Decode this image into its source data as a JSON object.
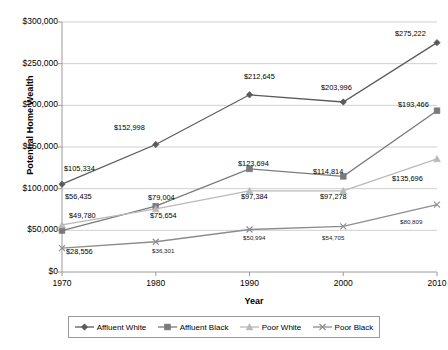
{
  "chart_data": {
    "type": "line",
    "title": "",
    "xlabel": "Year",
    "ylabel": "Potential Home Wealth",
    "categories": [
      "1970",
      "1980",
      "1990",
      "2000",
      "2010"
    ],
    "x": [
      1970,
      1980,
      1990,
      2000,
      2010
    ],
    "ylim": [
      0,
      300000
    ],
    "ytick_labels": [
      "$0",
      "$50,000",
      "$100,000",
      "$150,000",
      "$200,000",
      "$250,000",
      "$300,000"
    ],
    "ytick_values": [
      0,
      50000,
      100000,
      150000,
      200000,
      250000,
      300000
    ],
    "grid": true,
    "legend_position": "bottom",
    "series": [
      {
        "name": "Affluent White",
        "marker": "diamond",
        "color": "#5b5b5b",
        "values": [
          105334,
          152998,
          212645,
          203996,
          275222
        ],
        "labels": [
          "$105,334",
          "$152,998",
          "$212,645",
          "$203,996",
          "$275,222"
        ]
      },
      {
        "name": "Affluent Black",
        "marker": "square",
        "color": "#7a7a7a",
        "values": [
          49780,
          79004,
          123694,
          114814,
          193466
        ],
        "labels": [
          "$49,780",
          "$79,004",
          "$123,694",
          "$114,814",
          "$193,466"
        ]
      },
      {
        "name": "Poor White",
        "marker": "triangle",
        "color": "#b9b9b9",
        "values": [
          56435,
          75654,
          97384,
          97278,
          135696
        ],
        "labels": [
          "$56,435",
          "$75,654",
          "$97,384",
          "$97,278",
          "$135,696"
        ]
      },
      {
        "name": "Poor Black",
        "marker": "cross",
        "color": "#8c8c8c",
        "values": [
          28556,
          36301,
          50994,
          54705,
          80809
        ],
        "labels": [
          "$28,556",
          "$36,301",
          "$50,994",
          "$54,705",
          "$80,809"
        ]
      }
    ],
    "data_labels": [
      {
        "text": "$105,334",
        "x": 64,
        "y": 165,
        "size": "normal"
      },
      {
        "text": "$152,998",
        "x": 114,
        "y": 124,
        "size": "normal"
      },
      {
        "text": "$212,645",
        "x": 244,
        "y": 73,
        "size": "normal"
      },
      {
        "text": "$203,996",
        "x": 321,
        "y": 84,
        "size": "normal"
      },
      {
        "text": "$275,222",
        "x": 395,
        "y": 30,
        "size": "normal"
      },
      {
        "text": "$49,780",
        "x": 69,
        "y": 212,
        "size": "normal"
      },
      {
        "text": "$79,004",
        "x": 148,
        "y": 194,
        "size": "normal"
      },
      {
        "text": "$123,694",
        "x": 238,
        "y": 160,
        "size": "normal"
      },
      {
        "text": "$114,814",
        "x": 313,
        "y": 168,
        "size": "normal"
      },
      {
        "text": "$193,466",
        "x": 398,
        "y": 101,
        "size": "normal"
      },
      {
        "text": "$56,435",
        "x": 65,
        "y": 193,
        "size": "normal"
      },
      {
        "text": "$75,654",
        "x": 150,
        "y": 212,
        "size": "normal"
      },
      {
        "text": "$97,384",
        "x": 241,
        "y": 193,
        "size": "normal"
      },
      {
        "text": "$97,278",
        "x": 320,
        "y": 193,
        "size": "normal"
      },
      {
        "text": "$135,696",
        "x": 392,
        "y": 175,
        "size": "normal"
      },
      {
        "text": "$28,556",
        "x": 66,
        "y": 248,
        "size": "normal"
      },
      {
        "text": "$36,301",
        "x": 152,
        "y": 248,
        "size": "small"
      },
      {
        "text": "$50,994",
        "x": 243,
        "y": 235,
        "size": "small"
      },
      {
        "text": "$54,705",
        "x": 322,
        "y": 235,
        "size": "small"
      },
      {
        "text": "$80,809",
        "x": 400,
        "y": 219,
        "size": "small"
      }
    ]
  },
  "legend": {
    "items": [
      {
        "label": "Affluent White"
      },
      {
        "label": "Affluent Black"
      },
      {
        "label": "Poor White"
      },
      {
        "label": "Poor Black"
      }
    ]
  }
}
